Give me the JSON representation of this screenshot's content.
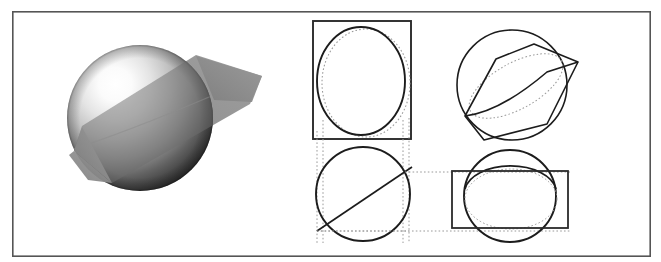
{
  "figure": {
    "title": "Sphere intersected by a plane with orthographic projection views",
    "canvas": {
      "width": 661,
      "height": 262,
      "background": "#ffffff"
    },
    "border": {
      "name": "figure-border",
      "x": 12,
      "y": 11,
      "width": 639,
      "height": 246,
      "stroke": "#555555",
      "stroke_width": 1.6,
      "fill": "none"
    },
    "colors": {
      "ink": "#1c1c1c",
      "border_gray": "#555555",
      "dotted_gray": "#9a9a9a",
      "plane_gray": "#8d8d8d",
      "plane_gray_dark": "#6f6f6f",
      "sphere_highlight": "#ffffff",
      "sphere_mid": "#b8b8b8",
      "sphere_shadow": "#2a2a2a",
      "sphere_terminator": "#6a6a6a"
    }
  },
  "panels": [
    {
      "id": "rendered-sphere",
      "label": "Shaded sphere cut by a translucent plane",
      "type": "raster-render",
      "bbox": {
        "x": 40,
        "y": 25,
        "width": 230,
        "height": 215
      }
    },
    {
      "id": "front-view",
      "label": "Front view: bounding rectangle with circle and dotted ellipse",
      "type": "orthographic-projection",
      "bbox": {
        "x": 313,
        "y": 21,
        "width": 98,
        "height": 118
      }
    },
    {
      "id": "pictorial-view",
      "label": "Pictorial view: circle with tilted cutting plane quadrilateral",
      "type": "pictorial-projection",
      "bbox": {
        "x": 455,
        "y": 28,
        "width": 120,
        "height": 112
      }
    },
    {
      "id": "top-view",
      "label": "Top view: circle with diagonal edge-on cutting line",
      "type": "orthographic-projection",
      "bbox": {
        "x": 316,
        "y": 146,
        "width": 94,
        "height": 96
      }
    },
    {
      "id": "side-view",
      "label": "Side view: circle with wide rectangle and dotted ellipse",
      "type": "orthographic-projection",
      "bbox": {
        "x": 452,
        "y": 150,
        "width": 117,
        "height": 93
      }
    }
  ],
  "geometry": {
    "rendered_sphere": {
      "center_x": 140,
      "center_y": 118,
      "radius": 73,
      "highlight_x": 108,
      "highlight_y": 82,
      "plane_polygon": "196,55 260,75 255,100 112,182 75,150 80,127",
      "plane_opacity": 0.62
    },
    "front_view": {
      "rect": {
        "x": 313,
        "y": 21,
        "width": 98,
        "height": 118
      },
      "solid_ellipse": {
        "cx": 361,
        "cy": 81,
        "rx": 44,
        "ry": 54
      },
      "dotted_ellipse": {
        "cx": 365,
        "cy": 83,
        "rx": 44,
        "ry": 54
      },
      "dotted_verticals_x": [
        317,
        409
      ],
      "dotted_vertical_y1": 131,
      "dotted_vertical_y2": 243
    },
    "pictorial_view": {
      "circle": {
        "cx": 512,
        "cy": 85,
        "r": 55
      },
      "plane_quad": "537,46 575,63 546,122 491,137 467,117 492,62",
      "plane_outline": "533,44 578,62 549,124 486,139 466,115 496,60",
      "dotted_ellipse": {
        "cx": 518,
        "cy": 84,
        "rx": 52,
        "ry": 24,
        "rotation": -28
      }
    },
    "top_view": {
      "circle": {
        "cx": 363,
        "cy": 194,
        "r": 47
      },
      "chord": {
        "x1": 318,
        "y1": 231,
        "x2": 409,
        "y2": 169
      },
      "dotted_box": {
        "x": 317,
        "y": 146,
        "width": 92,
        "height": 85
      },
      "dotted_extensions_x": [
        323,
        403
      ]
    },
    "side_view": {
      "circle": {
        "cx": 510,
        "cy": 196,
        "r": 46
      },
      "rect": {
        "x": 452,
        "y": 171,
        "width": 116,
        "height": 57
      },
      "dotted_ellipse": {
        "cx": 511,
        "cy": 198,
        "rx": 46,
        "ry": 30
      },
      "connector_y": [
        172,
        226
      ],
      "connector_x1": 409,
      "connector_x2": 452
    }
  },
  "strokes": {
    "solid_thick": 1.9,
    "solid_thin": 1.5,
    "dotted_width": 1.0,
    "dotted_dasharray": "1.6 2.2"
  }
}
